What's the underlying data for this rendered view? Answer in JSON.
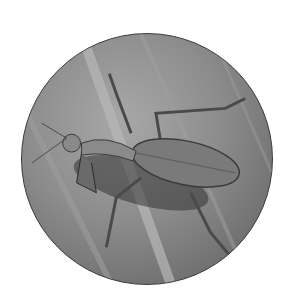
{
  "image": {
    "alt": "Grayscale circular photo of a praying mantis on a leaf",
    "subject": "praying mantis",
    "background_subject": "leaf",
    "shape": "circle",
    "colors": {
      "page_background": "#ffffff",
      "border": "#3a3a3a",
      "leaf_light": "#b4b4b4",
      "leaf_dark": "#5a5a5a",
      "mantis_body": "#7a7a7a",
      "shadow": "#2a2a2a"
    }
  }
}
